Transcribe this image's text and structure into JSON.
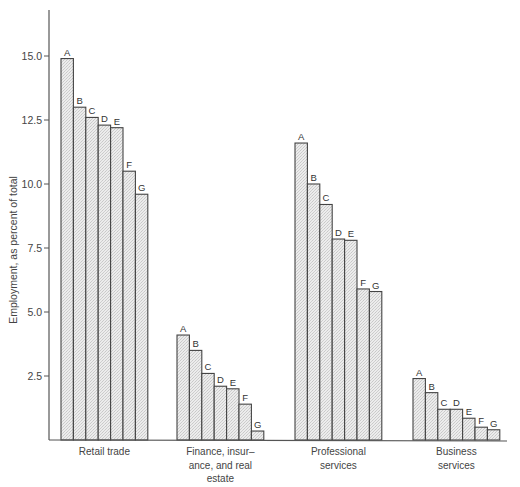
{
  "chart_data": {
    "type": "bar",
    "title": "",
    "xlabel": "",
    "ylabel": "Employment, as percent of total",
    "ylim": [
      0,
      16.5
    ],
    "yticks": [
      "2.5",
      "5.0",
      "7.5",
      "10.0",
      "12.5",
      "15.0"
    ],
    "ytick_values": [
      2.5,
      5.0,
      7.5,
      10.0,
      12.5,
      15.0
    ],
    "grid": false,
    "legend": "none; bars labeled A–G within each group",
    "bar_labels": [
      "A",
      "B",
      "C",
      "D",
      "E",
      "F",
      "G"
    ],
    "categories": [
      "Retail trade",
      "Finance, insurance, and real estate",
      "Professional services",
      "Business services"
    ],
    "category_label_lines": [
      [
        "Retail trade"
      ],
      [
        "Finance, insur–",
        "ance, and real",
        "estate"
      ],
      [
        "Professional",
        "services"
      ],
      [
        "Business",
        "services"
      ]
    ],
    "series": [
      {
        "name": "A",
        "values": [
          14.9,
          4.1,
          11.6,
          2.4
        ]
      },
      {
        "name": "B",
        "values": [
          13.0,
          3.5,
          10.0,
          1.85
        ]
      },
      {
        "name": "C",
        "values": [
          12.6,
          2.6,
          9.2,
          1.2
        ]
      },
      {
        "name": "D",
        "values": [
          12.3,
          2.1,
          7.85,
          1.2
        ]
      },
      {
        "name": "E",
        "values": [
          12.2,
          2.0,
          7.8,
          0.85
        ]
      },
      {
        "name": "F",
        "values": [
          10.5,
          1.4,
          5.9,
          0.5
        ]
      },
      {
        "name": "G",
        "values": [
          9.6,
          0.35,
          5.8,
          0.4
        ]
      }
    ],
    "colors": {
      "bar_fill": "#e2e2e2",
      "bar_stroke": "#444444",
      "axis": "#555555"
    }
  }
}
